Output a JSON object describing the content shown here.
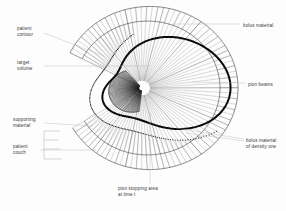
{
  "figure": {
    "background_color": "#fdfdfd",
    "width": 286,
    "height": 211
  },
  "colors": {
    "target_outline": "#0a0a0a",
    "beam": "#4a4a4a",
    "beam_faint": "#8e8e8e",
    "beam_dense": "#1c1c1c",
    "hatch": "#7d7d7d",
    "leader": "#b9b9b9",
    "label_text": "#3a3a3a",
    "bolus_fill": "#ffffff",
    "contour_dot": "#2e2e2e"
  },
  "geometry": {
    "focus_x": 142,
    "focus_y": 88,
    "outer_radius": 96,
    "inner_radius": 8,
    "beam_count": 84,
    "beam_span_degrees": 300
  },
  "labels": {
    "patient_contour": {
      "line1": "patient",
      "line2": "contour",
      "x": 17,
      "y": 30
    },
    "target_volume": {
      "line1": "target",
      "line2": "volume",
      "x": 17,
      "y": 64
    },
    "supporting_material": {
      "line1": "supporting",
      "line2": "material",
      "x": 13,
      "y": 121
    },
    "patient_couch": {
      "line1": "patient",
      "line2": "couch",
      "x": 13,
      "y": 148
    },
    "bolus_material": {
      "line1": "bolus material",
      "x": 243,
      "y": 27
    },
    "pion_beams": {
      "line1": "pion beams",
      "x": 248,
      "y": 86
    },
    "bolus_material_density": {
      "line1": "bolus material",
      "line2": "of density one",
      "x": 246,
      "y": 142
    },
    "pion_stopping_area": {
      "line1": "pion stopping area",
      "line2": "at time t",
      "x": 118,
      "y": 190
    }
  },
  "regions": {
    "target_volume_name": "target-volume",
    "supporting_material_name": "supporting-material",
    "bolus_name": "bolus-material-ring",
    "stopping_area_name": "pion-stopping-area",
    "couch_name": "patient-couch"
  }
}
